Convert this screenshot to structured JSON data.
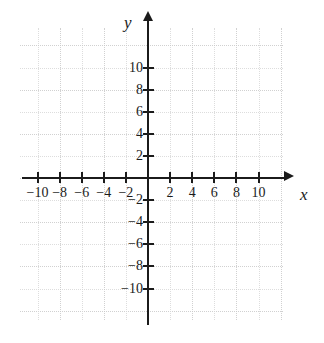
{
  "figure": {
    "kind": "cartesian-coordinate-plane",
    "background_color": "#ffffff",
    "axis_color": "#1b1b1b",
    "grid_color": "#d8d8d8",
    "grid_major_color": "#c9c9c9"
  },
  "axes": {
    "x": {
      "name": "x",
      "min": -12,
      "max": 12,
      "tick_step": 2,
      "labeled_ticks": [
        -10,
        -8,
        -6,
        -4,
        -2,
        2,
        4,
        6,
        8,
        10
      ],
      "tick_labels": [
        "−10",
        "−8",
        "−6",
        "−4",
        "−2",
        "2",
        "4",
        "6",
        "8",
        "10"
      ],
      "arrow": "right"
    },
    "y": {
      "name": "y",
      "min": -12,
      "max": 12,
      "tick_step": 2,
      "labeled_ticks": [
        10,
        8,
        6,
        4,
        2,
        -2,
        -4,
        -6,
        -8,
        -10
      ],
      "tick_labels": [
        "10",
        "8",
        "6",
        "4",
        "2",
        "−2",
        "−4",
        "−6",
        "−8",
        "−10"
      ],
      "arrow": "up"
    }
  },
  "chart_data": {
    "type": "scatter",
    "title": "",
    "subtitle": "",
    "xlabel": "x",
    "ylabel": "y",
    "xlim": [
      -12,
      12
    ],
    "ylim": [
      -12,
      12
    ],
    "xticks": [
      -10,
      -8,
      -6,
      -4,
      -2,
      2,
      4,
      6,
      8,
      10
    ],
    "yticks": [
      -10,
      -8,
      -6,
      -4,
      -2,
      2,
      4,
      6,
      8,
      10
    ],
    "xticklabels": [
      "−10",
      "−8",
      "−6",
      "−4",
      "−2",
      "2",
      "4",
      "6",
      "8",
      "10"
    ],
    "yticklabels": [
      "10",
      "8",
      "6",
      "4",
      "2",
      "−2",
      "−4",
      "−6",
      "−8",
      "−10"
    ],
    "grid": true,
    "grid_step": 2,
    "legend": null,
    "series": [],
    "annotations": []
  }
}
